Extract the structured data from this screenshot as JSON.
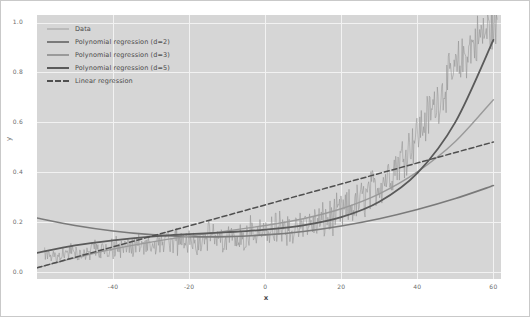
{
  "chart_data": {
    "type": "line",
    "title": "",
    "xlabel": "x",
    "ylabel": "y",
    "xlim": [
      -60,
      62
    ],
    "ylim": [
      -0.03,
      1.03
    ],
    "xticks": [
      -40,
      -20,
      0,
      20,
      40,
      60
    ],
    "xticklabels": [
      "-40",
      "-20",
      "0",
      "20",
      "40",
      "60"
    ],
    "yticks": [
      0.0,
      0.2,
      0.4,
      0.6,
      0.8,
      1.0
    ],
    "yticklabels": [
      "0.0",
      "0.2",
      "0.4",
      "0.6",
      "0.8",
      "1.0"
    ],
    "grid": true,
    "grid_color": "#f2f2f2",
    "plot_bgcolor": "#d6d6d6",
    "figure_bgcolor": "#ffffff",
    "legend_position": "upper left",
    "series": [
      {
        "name": "Data",
        "style": "noisy-line",
        "color": "#8d8d8d",
        "x": [
          -57,
          -54,
          -51,
          -48,
          -45,
          -42,
          -39,
          -36,
          -33,
          -30,
          -27,
          -24,
          -21,
          -18,
          -15,
          -12,
          -9,
          -6,
          -3,
          0,
          3,
          6,
          9,
          12,
          15,
          18,
          21,
          24,
          27,
          30,
          33,
          36,
          39,
          42,
          45,
          48,
          51,
          54,
          57,
          60
        ],
        "values": [
          0.07,
          0.06,
          0.08,
          0.07,
          0.09,
          0.08,
          0.1,
          0.09,
          0.11,
          0.1,
          0.12,
          0.11,
          0.13,
          0.12,
          0.14,
          0.13,
          0.15,
          0.14,
          0.16,
          0.15,
          0.17,
          0.16,
          0.18,
          0.19,
          0.2,
          0.22,
          0.24,
          0.27,
          0.31,
          0.35,
          0.4,
          0.46,
          0.53,
          0.6,
          0.68,
          0.76,
          0.83,
          0.9,
          0.95,
          0.98
        ],
        "noise_amplitude": 0.07
      },
      {
        "name": "Polynomial regression (d=2)",
        "style": "solid",
        "color": "#7a7a7a",
        "linewidth": 1.6,
        "x": [
          -60,
          -50,
          -40,
          -30,
          -20,
          -10,
          0,
          10,
          20,
          30,
          40,
          50,
          60
        ],
        "values": [
          0.215,
          0.185,
          0.163,
          0.148,
          0.14,
          0.14,
          0.147,
          0.161,
          0.183,
          0.212,
          0.249,
          0.293,
          0.345
        ]
      },
      {
        "name": "Polynomial regression (d=3)",
        "style": "solid",
        "color": "#9a9a9a",
        "linewidth": 1.4,
        "x": [
          -60,
          -50,
          -40,
          -30,
          -20,
          -10,
          0,
          10,
          20,
          30,
          40,
          50,
          60
        ],
        "values": [
          0.015,
          0.055,
          0.09,
          0.118,
          0.142,
          0.163,
          0.185,
          0.212,
          0.252,
          0.312,
          0.4,
          0.522,
          0.69
        ]
      },
      {
        "name": "Polynomial regression (d=5)",
        "style": "solid",
        "color": "#5a5a5a",
        "linewidth": 1.8,
        "x": [
          -60,
          -50,
          -40,
          -30,
          -20,
          -10,
          0,
          10,
          20,
          30,
          40,
          50,
          60
        ],
        "values": [
          0.075,
          0.105,
          0.125,
          0.14,
          0.15,
          0.158,
          0.168,
          0.185,
          0.218,
          0.28,
          0.395,
          0.6,
          0.93
        ]
      },
      {
        "name": "Linear regression",
        "style": "dashed",
        "color": "#4f4f4f",
        "linewidth": 1.5,
        "x": [
          -60,
          60
        ],
        "values": [
          0.015,
          0.52
        ]
      }
    ]
  },
  "legend": {
    "items": [
      {
        "label": "Data",
        "color": "#9e9e9e",
        "style": "solid",
        "width": 1
      },
      {
        "label": "Polynomial regression (d=2)",
        "color": "#7a7a7a",
        "style": "solid",
        "width": 2
      },
      {
        "label": "Polynomial regression (d=3)",
        "color": "#9a9a9a",
        "style": "solid",
        "width": 2
      },
      {
        "label": "Polynomial regression (d=5)",
        "color": "#5a5a5a",
        "style": "solid",
        "width": 2
      },
      {
        "label": "Linear regression",
        "color": "#4f4f4f",
        "style": "dashed",
        "width": 2
      }
    ]
  }
}
